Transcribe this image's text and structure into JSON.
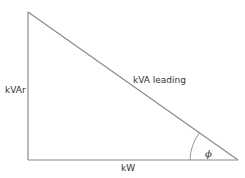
{
  "diagram": {
    "type": "power-triangle",
    "labels": {
      "vertical_side": "kVAr",
      "hypotenuse": "kVA leading",
      "horizontal_side": "kW",
      "angle": "ϕ"
    },
    "colors": {
      "line": "#8a8a8a",
      "text": "#333333",
      "background": "#ffffff"
    }
  }
}
